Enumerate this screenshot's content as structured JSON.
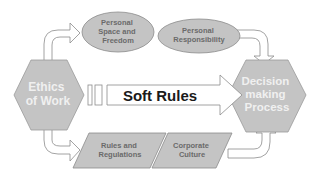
{
  "diagram": {
    "source_node": {
      "lines": [
        "Ethics",
        "of Work"
      ]
    },
    "target_node": {
      "lines": [
        "Decision",
        "making",
        "Process"
      ]
    },
    "top_nodes": [
      {
        "lines": [
          "Personal",
          "Space and",
          "Freedom"
        ]
      },
      {
        "lines": [
          "Personal",
          "Responsibility"
        ]
      }
    ],
    "bottom_nodes": [
      {
        "lines": [
          "Rules and",
          "Regulations"
        ]
      },
      {
        "lines": [
          "Corporate",
          "Culture"
        ]
      }
    ],
    "center_arrow": {
      "label": "Soft Rules"
    }
  },
  "colors": {
    "shape_fill": "#c4c4c4",
    "shape_stroke": "#8c8c8c",
    "arrow_fill": "#ffffff",
    "arrow_stroke": "#8c8c8c",
    "hex_text": "#f0f0f0",
    "node_text": "#6a6a6a",
    "center_text": "#1a1a1a"
  }
}
